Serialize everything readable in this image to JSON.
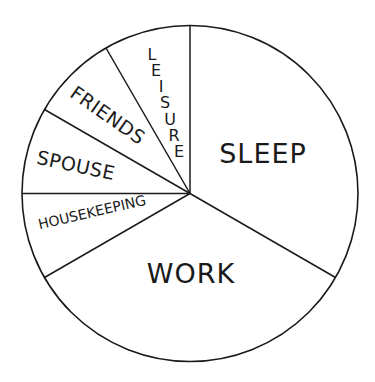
{
  "chart_data": {
    "type": "pie",
    "title": "",
    "unit": "hours per day (estimated from slice angles)",
    "start_angle_deg": 0,
    "direction": "clockwise",
    "categories": [
      "SLEEP",
      "WORK",
      "HOUSEKEEPING",
      "SPOUSE",
      "FRIENDS",
      "LEISURE"
    ],
    "values": [
      8,
      8,
      2,
      2,
      2,
      2
    ],
    "angles_deg": [
      120,
      120,
      30,
      30,
      30,
      30
    ],
    "legend": "none (labels drawn inside slices)",
    "colors": {
      "fill": "#ffffff",
      "stroke": "#1a1a1a",
      "text": "#1a1a1a"
    }
  },
  "labels": {
    "sleep": "SLEEP",
    "work": "WORK",
    "housekeeping": "HOUSEKEEPING",
    "spouse": "SPOUSE",
    "friends": "FRIENDS",
    "leisure_letters": [
      "L",
      "E",
      "I",
      "S",
      "U",
      "R",
      "E"
    ]
  }
}
